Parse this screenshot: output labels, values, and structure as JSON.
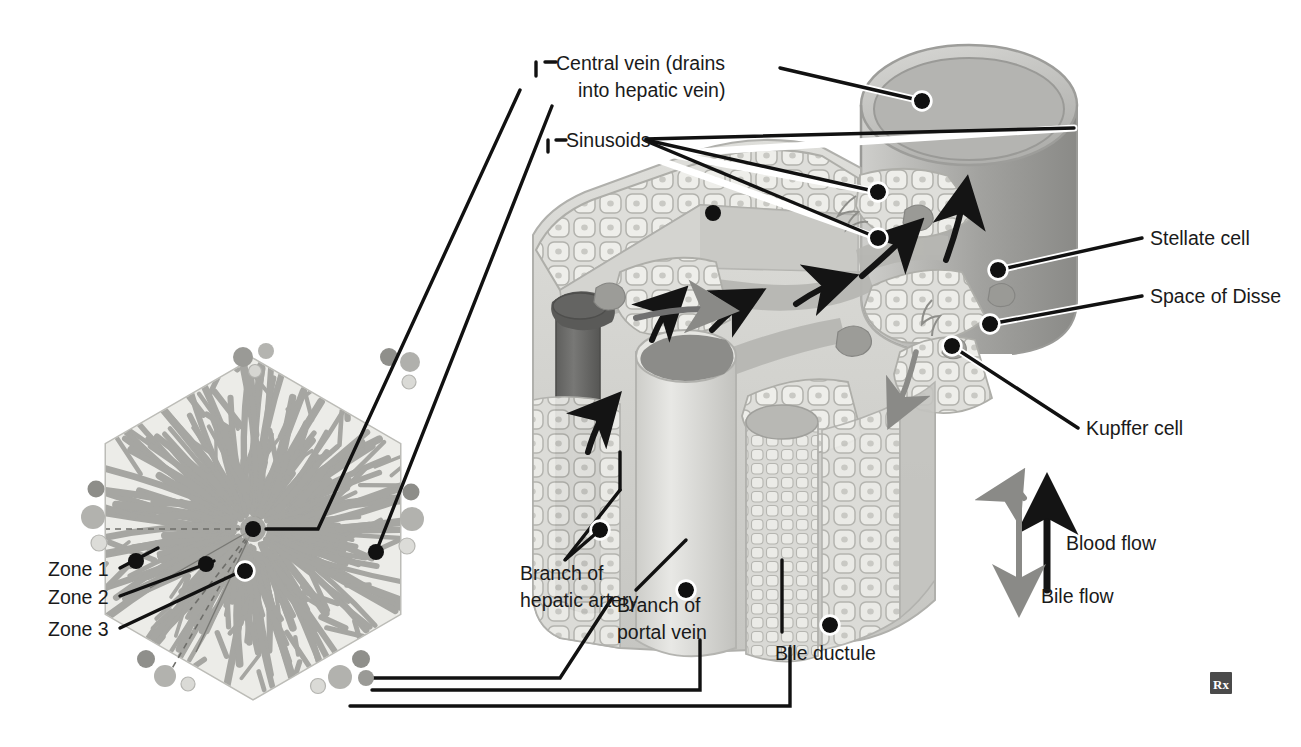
{
  "figure": {
    "watermark": "Rx"
  },
  "labels": {
    "central_vein_l1": "Central vein (drains",
    "central_vein_l2": "into hepatic vein)",
    "sinusoids": "Sinusoids",
    "stellate_cell": "Stellate cell",
    "space_of_disse": "Space of Disse",
    "kupffer_cell": "Kupffer cell",
    "blood_flow": "Blood flow",
    "bile_flow": "Bile flow",
    "zone_1": "Zone 1",
    "zone_2": "Zone 2",
    "zone_3": "Zone 3",
    "hepatic_artery_l1": "Branch of",
    "hepatic_artery_l2": "hepatic artery",
    "portal_vein_l1": "Branch of",
    "portal_vein_l2": "portal vein",
    "bile_ductule": "Bile ductule"
  },
  "colors": {
    "leader": "#111111",
    "leader_halo": "#ffffff",
    "text": "#1a1a1a",
    "lobule_fill": "#e8e8e4",
    "lobule_edge": "#b9b9b4",
    "sinusoid_gray": "#a8a8a4",
    "hepatocyte_fill": "#e4e4e0",
    "hepatocyte_edge": "#adada8",
    "central_vein_light": "#c9c9c6",
    "central_vein_mid": "#a9a9a6",
    "central_vein_dark": "#8d8d8a",
    "artery_dark": "#6f6f6d",
    "portal_light": "#dcdcd8",
    "lumen_dark": "#7b7b78",
    "arrow_black": "#141414",
    "arrow_gray": "#8a8a87",
    "watermark_box": "#4a4a4a"
  },
  "diagram": {
    "lobule": {
      "name": "hepatic lobule hexagon",
      "center": [
        253,
        529
      ],
      "radius": 170,
      "zones": [
        "Zone 1",
        "Zone 2",
        "Zone 3"
      ],
      "portal_triads": 6
    },
    "block": {
      "name": "three-dimensional sinusoid block",
      "central_vein_cylinder": true,
      "hepatic_artery_cylinder": true,
      "portal_vein_cylinder": true
    },
    "flow_arrows": {
      "blood": "upward black arrow",
      "bile": "downward gray double arrow"
    }
  }
}
